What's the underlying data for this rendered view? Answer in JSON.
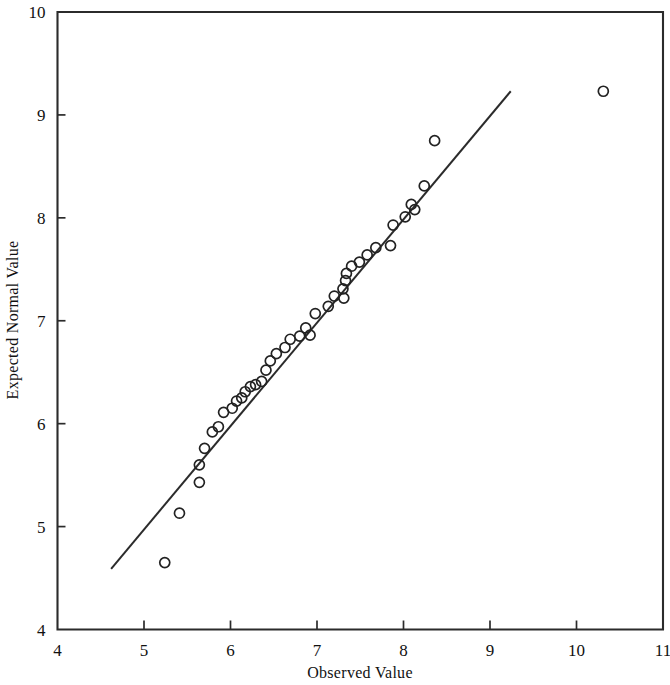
{
  "chart_data": {
    "type": "scatter",
    "title": "",
    "subtitle": "",
    "xlabel": "Observed Value",
    "ylabel": "Expected Normal Value",
    "xlim": [
      4,
      11
    ],
    "ylim": [
      4,
      10
    ],
    "xticks": [
      4,
      5,
      6,
      7,
      8,
      9,
      10,
      11
    ],
    "yticks": [
      4,
      5,
      6,
      7,
      8,
      9,
      10
    ],
    "xtick_labels": [
      "4",
      "5",
      "6",
      "7",
      "8",
      "9",
      "10",
      "11"
    ],
    "ytick_labels": [
      "4",
      "5",
      "6",
      "7",
      "8",
      "9",
      "10"
    ],
    "grid": false,
    "legend": null,
    "marker": "open-circle",
    "marker_radius_px": 5,
    "point_color": "#222222",
    "line_color": "#2b2b2b",
    "x": [
      5.24,
      5.41,
      5.64,
      5.64,
      5.7,
      5.79,
      5.86,
      5.92,
      6.02,
      6.07,
      6.13,
      6.17,
      6.23,
      6.29,
      6.36,
      6.41,
      6.46,
      6.53,
      6.63,
      6.69,
      6.8,
      6.87,
      6.92,
      6.98,
      7.13,
      7.2,
      7.3,
      7.31,
      7.33,
      7.34,
      7.4,
      7.49,
      7.58,
      7.68,
      7.85,
      7.88,
      8.02,
      8.09,
      8.13,
      8.24,
      8.36,
      10.31
    ],
    "y": [
      4.65,
      5.13,
      5.6,
      5.76,
      5.43,
      5.92,
      5.97,
      6.11,
      6.22,
      6.15,
      6.25,
      6.31,
      6.38,
      6.41,
      6.36,
      6.52,
      6.61,
      6.68,
      6.74,
      6.82,
      6.85,
      6.93,
      6.86,
      7.07,
      7.14,
      7.24,
      7.31,
      7.22,
      7.39,
      7.46,
      7.53,
      7.57,
      7.64,
      7.71,
      7.73,
      7.93,
      8.01,
      8.13,
      8.08,
      8.31,
      8.75,
      9.23
    ],
    "points": [
      {
        "x": 5.24,
        "y": 4.65
      },
      {
        "x": 5.41,
        "y": 5.13
      },
      {
        "x": 5.64,
        "y": 5.43
      },
      {
        "x": 5.64,
        "y": 5.6
      },
      {
        "x": 5.7,
        "y": 5.76
      },
      {
        "x": 5.79,
        "y": 5.92
      },
      {
        "x": 5.86,
        "y": 5.97
      },
      {
        "x": 5.92,
        "y": 6.11
      },
      {
        "x": 6.02,
        "y": 6.15
      },
      {
        "x": 6.07,
        "y": 6.22
      },
      {
        "x": 6.13,
        "y": 6.25
      },
      {
        "x": 6.17,
        "y": 6.31
      },
      {
        "x": 6.23,
        "y": 6.36
      },
      {
        "x": 6.29,
        "y": 6.38
      },
      {
        "x": 6.36,
        "y": 6.41
      },
      {
        "x": 6.41,
        "y": 6.52
      },
      {
        "x": 6.46,
        "y": 6.61
      },
      {
        "x": 6.53,
        "y": 6.68
      },
      {
        "x": 6.63,
        "y": 6.74
      },
      {
        "x": 6.69,
        "y": 6.82
      },
      {
        "x": 6.8,
        "y": 6.85
      },
      {
        "x": 6.87,
        "y": 6.93
      },
      {
        "x": 6.92,
        "y": 6.86
      },
      {
        "x": 6.98,
        "y": 7.07
      },
      {
        "x": 7.13,
        "y": 7.14
      },
      {
        "x": 7.2,
        "y": 7.24
      },
      {
        "x": 7.3,
        "y": 7.31
      },
      {
        "x": 7.31,
        "y": 7.22
      },
      {
        "x": 7.33,
        "y": 7.39
      },
      {
        "x": 7.34,
        "y": 7.46
      },
      {
        "x": 7.4,
        "y": 7.53
      },
      {
        "x": 7.49,
        "y": 7.57
      },
      {
        "x": 7.58,
        "y": 7.64
      },
      {
        "x": 7.68,
        "y": 7.71
      },
      {
        "x": 7.85,
        "y": 7.73
      },
      {
        "x": 7.88,
        "y": 7.93
      },
      {
        "x": 8.02,
        "y": 8.01
      },
      {
        "x": 8.09,
        "y": 8.13
      },
      {
        "x": 8.13,
        "y": 8.08
      },
      {
        "x": 8.24,
        "y": 8.31
      },
      {
        "x": 8.36,
        "y": 8.75
      },
      {
        "x": 10.31,
        "y": 9.23
      }
    ],
    "reference_line": {
      "name": "normal-reference-line",
      "x0": 4.62,
      "y0": 4.59,
      "x1": 9.24,
      "y1": 9.23
    }
  },
  "figure": {
    "background": "#ffffff",
    "frame_color": "#2b2b2b"
  }
}
